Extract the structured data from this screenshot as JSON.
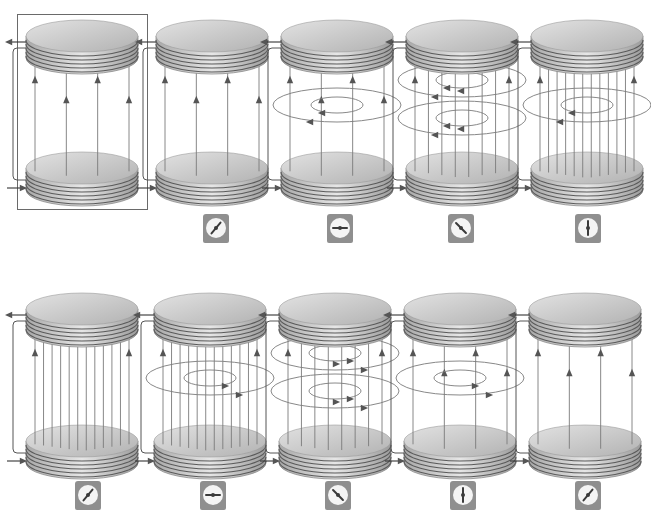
{
  "diagram": {
    "colors": {
      "plate_top": "#c9c9c9",
      "plate_edge": "#8c8c8c",
      "coil_line": "#5a5a5a",
      "field_line": "#7a7a7a",
      "arrow": "#555555",
      "meter_body": "#8f8f8f",
      "meter_face": "#f4f4f4",
      "needle": "#3a3a3a"
    },
    "rows": [
      {
        "panels": [
          {
            "id": "t1",
            "field_lines": 4,
            "magnetic_loops": 0,
            "loop_direction": "none",
            "framed": true,
            "meter": null
          },
          {
            "id": "t2",
            "field_lines": 4,
            "magnetic_loops": 0,
            "loop_direction": "none",
            "framed": false,
            "meter": {
              "needle_angle_deg": 40
            }
          },
          {
            "id": "t3",
            "field_lines": 4,
            "magnetic_loops": 1,
            "loop_direction": "left",
            "framed": false,
            "meter": {
              "needle_angle_deg": -90
            }
          },
          {
            "id": "t4",
            "field_lines": 8,
            "magnetic_loops": 2,
            "loop_direction": "left",
            "framed": false,
            "meter": {
              "needle_angle_deg": -45
            }
          },
          {
            "id": "t5",
            "field_lines": 12,
            "magnetic_loops": 1,
            "loop_direction": "left",
            "framed": false,
            "meter": {
              "needle_angle_deg": 0
            }
          }
        ]
      },
      {
        "panels": [
          {
            "id": "b1",
            "field_lines": 12,
            "magnetic_loops": 0,
            "loop_direction": "none",
            "framed": false,
            "meter": {
              "needle_angle_deg": 40
            }
          },
          {
            "id": "b2",
            "field_lines": 12,
            "magnetic_loops": 1,
            "loop_direction": "right",
            "framed": false,
            "meter": {
              "needle_angle_deg": 90
            }
          },
          {
            "id": "b3",
            "field_lines": 8,
            "magnetic_loops": 2,
            "loop_direction": "right",
            "framed": false,
            "meter": {
              "needle_angle_deg": 135
            }
          },
          {
            "id": "b4",
            "field_lines": 4,
            "magnetic_loops": 1,
            "loop_direction": "right",
            "framed": false,
            "meter": {
              "needle_angle_deg": 0
            }
          },
          {
            "id": "b5",
            "field_lines": 4,
            "magnetic_loops": 0,
            "loop_direction": "none",
            "framed": false,
            "meter": {
              "needle_angle_deg": 40
            }
          }
        ]
      }
    ]
  }
}
